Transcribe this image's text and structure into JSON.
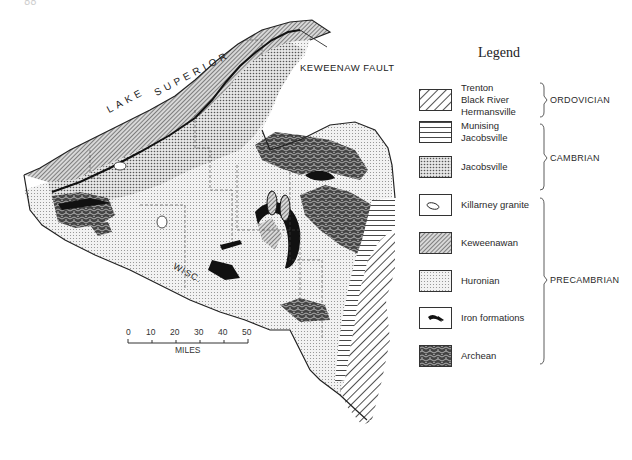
{
  "page": {
    "number": "88"
  },
  "map": {
    "labels": {
      "lake": "LAKE SUPERIOR",
      "lake_word1": "LAKE",
      "lake_word2": "SUPERIOR",
      "fault": "KEWEENAW FAULT",
      "state": "WISC."
    },
    "colors": {
      "ink": "#1a1a1a",
      "paper": "#ffffff",
      "stipple": "#bdbdbd"
    }
  },
  "scale": {
    "ticks": [
      "0",
      "10",
      "20",
      "30",
      "40",
      "50"
    ],
    "unit": "MILES"
  },
  "legend": {
    "title": "Legend",
    "items": [
      {
        "label": "Trenton\nBlack River\nHermansville",
        "pattern": "diagonal-hatch",
        "period": "ORDOVICIAN"
      },
      {
        "label": "Munising\nJacobsville",
        "pattern": "horizontal-lines",
        "period": "CAMBRIAN"
      },
      {
        "label": "Jacobsville",
        "pattern": "dense-stipple",
        "period": "CAMBRIAN"
      },
      {
        "label": "Killarney granite",
        "pattern": "outlined-blob",
        "period": "PRECAMBRIAN"
      },
      {
        "label": "Keweenawan",
        "pattern": "fine-diagonal",
        "period": "PRECAMBRIAN"
      },
      {
        "label": "Huronian",
        "pattern": "light-stipple",
        "period": "PRECAMBRIAN"
      },
      {
        "label": "Iron formations",
        "pattern": "black-streaks",
        "period": "PRECAMBRIAN"
      },
      {
        "label": "Archean",
        "pattern": "contorted-dark",
        "period": "PRECAMBRIAN"
      }
    ],
    "periods": {
      "ordovician": "ORDOVICIAN",
      "cambrian": "CAMBRIAN",
      "precambrian": "PRECAMBRIAN"
    }
  }
}
